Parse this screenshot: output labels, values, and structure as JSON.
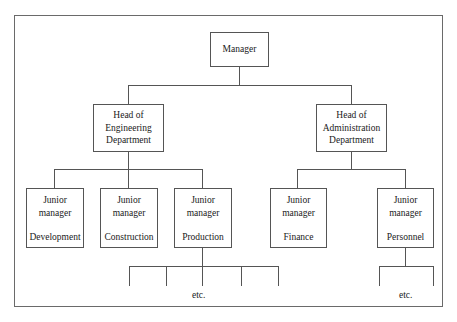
{
  "diagram": {
    "type": "org-chart",
    "root": {
      "label": "Manager",
      "children": [
        {
          "label_lines": [
            "Head of",
            "Engineering",
            "Department"
          ],
          "children": [
            {
              "title_lines": [
                "Junior",
                "manager"
              ],
              "dept": "Development"
            },
            {
              "title_lines": [
                "Junior",
                "manager"
              ],
              "dept": "Construction"
            },
            {
              "title_lines": [
                "Junior",
                "manager"
              ],
              "dept": "Production",
              "sub_branches": 5,
              "note": "etc."
            }
          ]
        },
        {
          "label_lines": [
            "Head of",
            "Administration",
            "Department"
          ],
          "children": [
            {
              "title_lines": [
                "Junior",
                "manager"
              ],
              "dept": "Finance"
            },
            {
              "title_lines": [
                "Junior",
                "manager"
              ],
              "dept": "Personnel",
              "sub_branches": 2,
              "note": "etc."
            }
          ]
        }
      ]
    }
  },
  "labels": {
    "manager": "Manager",
    "eng": [
      "Head of",
      "Engineering",
      "Department"
    ],
    "admin": [
      "Head of",
      "Administration",
      "Department"
    ],
    "junior": [
      "Junior",
      "manager"
    ],
    "depts": [
      "Development",
      "Construction",
      "Production",
      "Finance",
      "Personnel"
    ],
    "etc": "etc."
  },
  "colors": {
    "line": "#555555",
    "frame": "#6a6a6a",
    "text": "#1a1a1a",
    "background": "#ffffff"
  }
}
